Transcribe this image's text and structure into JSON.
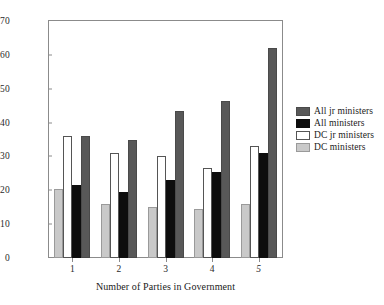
{
  "chart_data": {
    "type": "bar",
    "title": "",
    "xlabel": "Number of Parties in Government",
    "ylabel": "",
    "categories": [
      "1",
      "2",
      "3",
      "4",
      "5"
    ],
    "ylim": [
      0,
      70
    ],
    "yticks": [
      0,
      10,
      20,
      30,
      40,
      50,
      60,
      70
    ],
    "grid": false,
    "legend_position": "right",
    "series": [
      {
        "name": "All jr ministers",
        "color": "#585858",
        "values": [
          36,
          35,
          43.5,
          46.5,
          62
        ]
      },
      {
        "name": "All ministers",
        "color": "#0d0d0d",
        "values": [
          21.5,
          19.5,
          23,
          25.5,
          31
        ]
      },
      {
        "name": "DC jr ministers",
        "color": "#ffffff",
        "values": [
          36,
          31,
          30,
          26.5,
          33
        ]
      },
      {
        "name": "DC ministers",
        "color": "#c9c9c9",
        "values": [
          20.5,
          16,
          15,
          14.5,
          16
        ]
      }
    ],
    "draw_order": [
      "DC ministers",
      "DC jr ministers",
      "All ministers",
      "All jr ministers"
    ]
  }
}
